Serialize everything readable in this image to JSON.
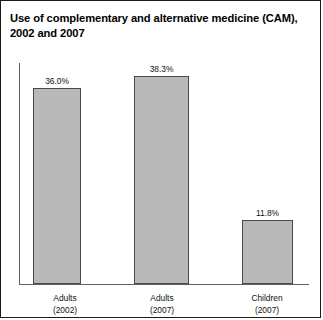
{
  "figure": {
    "title": "Use of complementary and alternative medicine (CAM), 2002 and 2007",
    "frame_color": "#1b1b1b",
    "bar_fill": "#b9b9b9",
    "bar_border": "#4a4a4a",
    "axis_color": "#5f5f5f"
  },
  "chart_data": {
    "type": "bar",
    "title": "Use of complementary and alternative medicine (CAM), 2002 and 2007",
    "xlabel": "",
    "ylabel": "",
    "ylim": [
      0,
      41
    ],
    "grid": false,
    "legend": "none",
    "categories": [
      "Adults (2002)",
      "Adults (2007)",
      "Children (2007)"
    ],
    "category_lines": [
      [
        "Adults",
        "(2002)"
      ],
      [
        "Adults",
        "(2007)"
      ],
      [
        "Children",
        "(2007)"
      ]
    ],
    "values": [
      36.0,
      38.3,
      11.8
    ],
    "value_labels": [
      "36.0%",
      "38.3%",
      "11.8%"
    ]
  }
}
